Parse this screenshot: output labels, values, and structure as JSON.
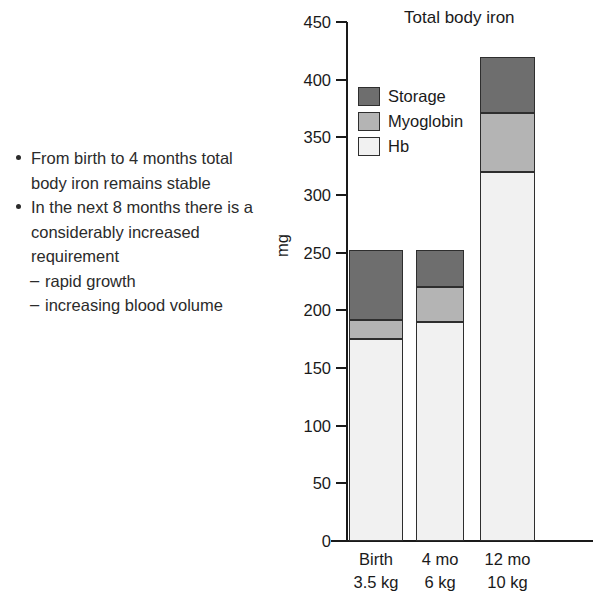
{
  "bullets": [
    {
      "text": "From birth to 4 months total body iron remains stable",
      "sub": []
    },
    {
      "text": "In the next 8 months there is a considerably increased requirement",
      "sub": [
        "rapid growth",
        "increasing blood volume"
      ]
    }
  ],
  "sub_marker": "–",
  "chart_data": {
    "type": "bar",
    "stacked": true,
    "title": "Total body iron",
    "xlabel": "",
    "ylabel": "mg",
    "ylim": [
      0,
      450
    ],
    "ytick_step": 50,
    "yticks": [
      "450",
      "400",
      "350",
      "300",
      "250",
      "200",
      "150",
      "100",
      "50",
      "0"
    ],
    "grid": false,
    "legend_position": "upper-left-inside",
    "categories": [
      "Birth",
      "4 mo",
      "12 mo"
    ],
    "category_sublabels": [
      "3.5 kg",
      "6 kg",
      "10 kg"
    ],
    "series": [
      {
        "name": "Hb",
        "color": "#f1f1f1",
        "values": [
          175,
          190,
          320
        ]
      },
      {
        "name": "Myoglobin",
        "color": "#b4b4b4",
        "values": [
          17,
          30,
          51
        ]
      },
      {
        "name": "Storage",
        "color": "#6e6e6e",
        "values": [
          60,
          32,
          49
        ]
      }
    ],
    "totals": [
      252,
      252,
      420
    ],
    "legend": [
      {
        "label": "Storage",
        "color": "#6e6e6e"
      },
      {
        "label": "Myoglobin",
        "color": "#b4b4b4"
      },
      {
        "label": "Hb",
        "color": "#f1f1f1"
      }
    ]
  }
}
